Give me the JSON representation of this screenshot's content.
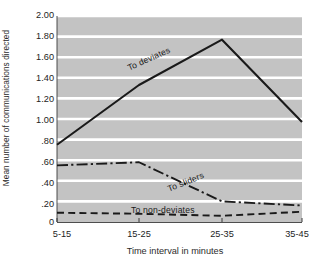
{
  "chart_data": {
    "type": "line",
    "title": "",
    "xlabel": "Time interval in minutes",
    "ylabel": "Mean number of communications directed",
    "categories": [
      "5-15",
      "15-25",
      "25-35",
      "35-45"
    ],
    "ylim": [
      0,
      2.0
    ],
    "yticks": [
      "2.00",
      "1.80",
      "1.60",
      "1.40",
      "1.20",
      "1.00",
      ".80",
      ".60",
      ".40",
      ".20",
      "0"
    ],
    "ytick_values": [
      2.0,
      1.8,
      1.6,
      1.4,
      1.2,
      1.0,
      0.8,
      0.6,
      0.4,
      0.2,
      0.0
    ],
    "grid": "horizontal-white-on-gray",
    "legend_position": "inline-annotations",
    "plot_background": "#c3c3c3",
    "gridline_color": "#ffffff",
    "line_color": "#1a1a1a",
    "series": [
      {
        "name": "To deviates",
        "style": "solid",
        "values": [
          0.75,
          1.33,
          1.77,
          0.97
        ]
      },
      {
        "name": "To sliders",
        "style": "dash-dot",
        "values": [
          0.55,
          0.58,
          0.2,
          0.16
        ]
      },
      {
        "name": "To non-deviates",
        "style": "dashed",
        "values": [
          0.09,
          0.08,
          0.06,
          0.1
        ]
      }
    ],
    "annotations": [
      {
        "text": "To deviates",
        "series": "To deviates",
        "rotation": -24
      },
      {
        "text": "To sliders",
        "series": "To sliders",
        "rotation": -22
      },
      {
        "text": "To non-deviates",
        "series": "To non-deviates",
        "rotation": 0
      }
    ]
  }
}
